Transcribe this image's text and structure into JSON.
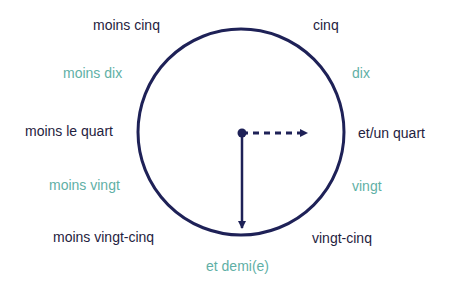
{
  "colors": {
    "dark_text": "#1f2240",
    "teal_text": "#5fb0a6",
    "clock_stroke": "#1e2157"
  },
  "clock": {
    "center": [
      241,
      132
    ],
    "radius": 103,
    "minute_hand": "solid arrow pointing down (half past)",
    "hour_hand": "dashed arrow pointing right (quarter)"
  },
  "labels": {
    "moins_cinq": "moins cinq",
    "cinq": "cinq",
    "moins_dix": "moins dix",
    "dix": "dix",
    "moins_le_quart": "moins le quart",
    "et_un_quart": "et/un quart",
    "moins_vingt": "moins vingt",
    "vingt": "vingt",
    "moins_vingt_cinq": "moins vingt-cinq",
    "vingt_cinq": "vingt-cinq",
    "et_demi": "et demi(e)"
  }
}
